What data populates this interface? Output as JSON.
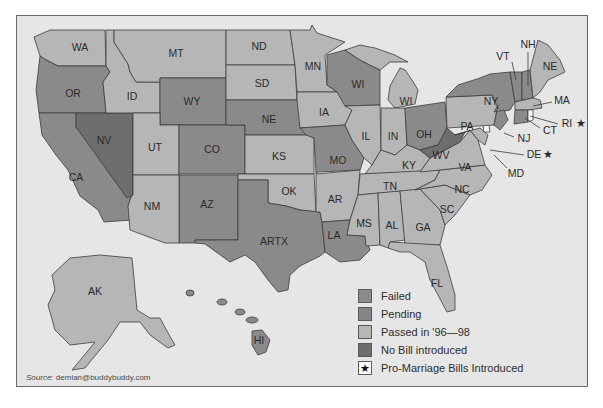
{
  "colors": {
    "failed": "#8a8a8a",
    "pending": "#929292",
    "passed": "#b6b6b6",
    "no_bill": "#6e6e6e",
    "water": "#e6e6e6",
    "white": "#ffffff"
  },
  "legend": {
    "items": [
      {
        "key": "failed",
        "label": "Failed"
      },
      {
        "key": "pending",
        "label": "Pending"
      },
      {
        "key": "passed",
        "label": "Passed in '96—98"
      },
      {
        "key": "no_bill",
        "label": "No Bill introduced"
      },
      {
        "key": "pro_marriage",
        "label": "Pro-Marriage Bills Introduced",
        "symbol": "★"
      }
    ]
  },
  "source": {
    "prefix": "Source:",
    "text": "demian@buddybuddy.com"
  },
  "states": {
    "WA": "WA",
    "OR": "OR",
    "CA": "CA",
    "ID": "ID",
    "NV": "NV",
    "MT": "MT",
    "WY": "WY",
    "UT": "UT",
    "CO": "CO",
    "AZ": "AZ",
    "NM": "NM",
    "ND": "ND",
    "SD": "SD",
    "NE": "NE",
    "KS": "KS",
    "OK": "OK",
    "TX": "ARTX",
    "MN": "MN",
    "IA": "IA",
    "MO": "MO",
    "AR": "AR",
    "LA": "LA",
    "WI": "WI",
    "MI": "WI",
    "IL": "IL",
    "IN": "IN",
    "OH": "OH",
    "KY": "KY",
    "TN": "TN",
    "MS": "MS",
    "AL": "AL",
    "GA": "GA",
    "FL": "FL",
    "SC": "SC",
    "NC": "NC",
    "VA": "VA",
    "WV": "WV",
    "PA": "PA",
    "NY": "NY",
    "VT": "VT",
    "NH": "NH",
    "ME": "NE",
    "MA": "MA",
    "RI": "RI",
    "CT": "CT",
    "NJ": "NJ",
    "DE": "DE",
    "MD": "MD",
    "AK": "AK",
    "HI": "HI"
  },
  "stars": {
    "RI": "★",
    "DE": "★"
  }
}
